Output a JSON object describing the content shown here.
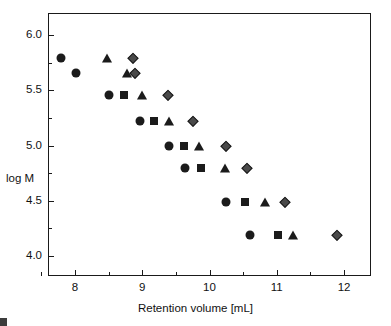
{
  "chart_data": {
    "type": "scatter",
    "title": "",
    "xlabel": "Retention volume [mL]",
    "ylabel": "log M",
    "xlim": [
      7.6,
      12.4
    ],
    "ylim": [
      3.82,
      6.2
    ],
    "grid": false,
    "legend": "none",
    "xticks": [
      8,
      9,
      10,
      11,
      12
    ],
    "xticklabels": [
      "8",
      "9",
      "10",
      "11",
      "12"
    ],
    "xminorticks": [
      7.5,
      8.5,
      9.5,
      10.5,
      11.5,
      12
    ],
    "yticks": [
      4.0,
      4.5,
      5.0,
      5.5,
      6.0
    ],
    "yticklabels": [
      "4.0",
      "4.5",
      "5.0",
      "5.5",
      "6.0"
    ],
    "yminorticks": [
      4.25,
      4.75,
      5.25,
      5.75
    ],
    "series": [
      {
        "name": "circle",
        "marker": "circle",
        "color": "#1b1b1b",
        "points": [
          {
            "x": 7.79,
            "y": 5.79
          },
          {
            "x": 8.02,
            "y": 5.66
          },
          {
            "x": 8.51,
            "y": 5.46
          },
          {
            "x": 8.96,
            "y": 5.22
          },
          {
            "x": 9.4,
            "y": 5.0
          },
          {
            "x": 9.63,
            "y": 4.8
          },
          {
            "x": 10.24,
            "y": 4.49
          },
          {
            "x": 10.6,
            "y": 4.19
          }
        ]
      },
      {
        "name": "square",
        "marker": "square",
        "color": "#1b1b1b",
        "points": [
          {
            "x": 8.73,
            "y": 5.46
          },
          {
            "x": 9.18,
            "y": 5.22
          },
          {
            "x": 9.62,
            "y": 5.0
          },
          {
            "x": 9.88,
            "y": 4.8
          },
          {
            "x": 10.53,
            "y": 4.49
          },
          {
            "x": 11.02,
            "y": 4.19
          }
        ]
      },
      {
        "name": "triangle",
        "marker": "triangle",
        "color": "#1b1b1b",
        "points": [
          {
            "x": 8.48,
            "y": 5.79
          },
          {
            "x": 8.78,
            "y": 5.66
          },
          {
            "x": 8.99,
            "y": 5.46
          },
          {
            "x": 9.4,
            "y": 5.22
          },
          {
            "x": 9.85,
            "y": 5.0
          },
          {
            "x": 10.23,
            "y": 4.8
          },
          {
            "x": 10.82,
            "y": 4.49
          },
          {
            "x": 11.24,
            "y": 4.19
          }
        ]
      },
      {
        "name": "diamond",
        "marker": "diamond",
        "color": "#4a4a4a",
        "points": [
          {
            "x": 8.87,
            "y": 5.79
          },
          {
            "x": 8.9,
            "y": 5.66
          },
          {
            "x": 9.39,
            "y": 5.46
          },
          {
            "x": 9.76,
            "y": 5.22
          },
          {
            "x": 10.24,
            "y": 5.0
          },
          {
            "x": 10.56,
            "y": 4.8
          },
          {
            "x": 11.12,
            "y": 4.49
          },
          {
            "x": 11.89,
            "y": 4.19
          }
        ]
      }
    ]
  }
}
